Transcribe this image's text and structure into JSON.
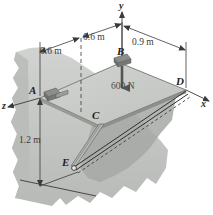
{
  "figure": {
    "axes": {
      "y": "y",
      "x": "x",
      "z": "z"
    },
    "points": {
      "A": "A",
      "B": "B",
      "C": "C",
      "D": "D",
      "E": "E"
    },
    "dimensions": {
      "a_to_b_left": "0.6 m",
      "a_to_b_right": "0.6 m",
      "b_to_d": "0.9 m",
      "vertical": "1.2 m"
    },
    "load": {
      "label": "600 N"
    },
    "colors": {
      "plate_top": "#c9cbc8",
      "plate_edge": "#8e918d",
      "wall": "#c2c4c1",
      "wall_shadow": "#a9aba8",
      "line": "#3a3a3a",
      "hinge": "#6f716e",
      "background": "#ffffff"
    }
  }
}
